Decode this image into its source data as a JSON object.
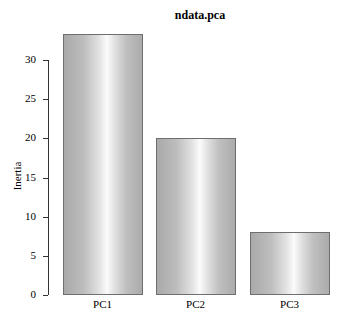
{
  "chart_data": {
    "type": "bar",
    "title": "ndata.pca",
    "xlabel": "",
    "ylabel": "Inertia",
    "categories": [
      "PC1",
      "PC2",
      "PC3"
    ],
    "values": [
      33.3,
      20.0,
      8.0
    ],
    "ylim": [
      0,
      33.3
    ],
    "yticks": [
      "0",
      "5",
      "10",
      "15",
      "20",
      "25",
      "30"
    ],
    "grid": false,
    "legend": null
  }
}
